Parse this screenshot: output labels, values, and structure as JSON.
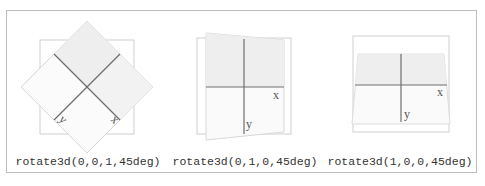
{
  "figure": {
    "panels": [
      {
        "caption": "rotate3d(0,0,1,45deg)",
        "axes": {
          "x_label": "x",
          "y_label": "y"
        },
        "transform": {
          "vector": [
            0,
            0,
            1
          ],
          "angle_deg": 45
        }
      },
      {
        "caption": "rotate3d(0,1,0,45deg)",
        "axes": {
          "x_label": "x",
          "y_label": "y"
        },
        "transform": {
          "vector": [
            0,
            1,
            0
          ],
          "angle_deg": 45
        }
      },
      {
        "caption": "rotate3d(1,0,0,45deg)",
        "axes": {
          "x_label": "x",
          "y_label": "y"
        },
        "transform": {
          "vector": [
            1,
            0,
            0
          ],
          "angle_deg": 45
        }
      }
    ],
    "colors": {
      "frame_border": "#bdbdbd",
      "reference_square": "#cfcfcf",
      "rotated_fill_top": "#eeeeee",
      "rotated_fill_bottom": "#fafafa",
      "axis_line": "#6e6e6e"
    }
  }
}
